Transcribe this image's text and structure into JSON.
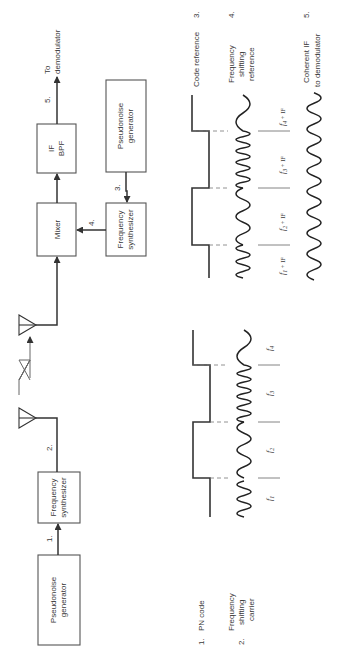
{
  "diagram": {
    "orientation": "rotated 90° counter-clockwise",
    "transmitter": {
      "pn_generator": {
        "line1": "Pseudonoise",
        "line2": "generator"
      },
      "frequency_synthesizer": {
        "line1": "Frequency",
        "line2": "synthesizer"
      },
      "signal_labels": {
        "s1": "1.",
        "s2": "2."
      }
    },
    "receiver": {
      "mixer": {
        "label": "Mixer"
      },
      "if_bpf": {
        "line1": "IF",
        "line2": "BPF"
      },
      "pn_generator": {
        "line1": "Pseudonoise",
        "line2": "generator"
      },
      "frequency_synthesizer": {
        "line1": "Frequency",
        "line2": "synthesizer"
      },
      "signal_labels": {
        "s3": "3.",
        "s4": "4.",
        "s5": "5."
      },
      "output": {
        "line1": "To",
        "line2": "demodulator"
      }
    },
    "waveforms": {
      "transmit": {
        "legend": [
          {
            "num": "1.",
            "text": "PN code"
          },
          {
            "num": "2.",
            "line1": "Frequency",
            "line2": "shifting",
            "line3": "carrier"
          }
        ],
        "segments": [
          "f1",
          "f2",
          "f3",
          "f4"
        ],
        "segment_labels": [
          {
            "sym": "f",
            "sub": "1"
          },
          {
            "sym": "f",
            "sub": "2"
          },
          {
            "sym": "f",
            "sub": "3"
          },
          {
            "sym": "f",
            "sub": "4"
          }
        ]
      },
      "receive": {
        "legend": [
          {
            "num": "3.",
            "text": "Code reference"
          },
          {
            "num": "4.",
            "line1": "Frequency",
            "line2": "shifting",
            "line3": "reference"
          },
          {
            "num": "5.",
            "line1": "Coherent IF",
            "line2": "to demodulator"
          }
        ],
        "segment_labels": [
          {
            "sym": "f",
            "sub": "1",
            "suffix": " + IF"
          },
          {
            "sym": "f",
            "sub": "2",
            "suffix": " + IF"
          },
          {
            "sym": "f",
            "sub": "3",
            "suffix": " + IF"
          },
          {
            "sym": "f",
            "sub": "4",
            "suffix": " + IF"
          }
        ]
      }
    }
  }
}
